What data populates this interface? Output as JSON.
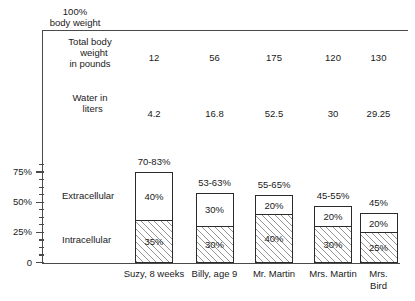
{
  "chart_data": {
    "type": "bar",
    "title": "",
    "top_caption": "100%\nbody weight",
    "xlabel": "",
    "ylabel": "",
    "ylim": [
      0,
      85
    ],
    "grid": false,
    "legend_position": "inline-left",
    "y_ticks": [
      {
        "value": 75,
        "label": "75%"
      },
      {
        "value": 50,
        "label": "50%"
      },
      {
        "value": 25,
        "label": "25%"
      },
      {
        "value": 0,
        "label": "0"
      }
    ],
    "categories": [
      "Suzy,\n8 weeks",
      "Billy,\nage 9",
      "Mr.\nMartin",
      "Mrs.\nMartin",
      "Mrs.\nBird"
    ],
    "series": [
      {
        "name": "Intracellular",
        "values": [
          35,
          30,
          40,
          30,
          25
        ],
        "labels": [
          "35%",
          "30%",
          "40%",
          "30%",
          "25%"
        ]
      },
      {
        "name": "Extracellular",
        "values": [
          40,
          30,
          20,
          20,
          20
        ],
        "labels": [
          "40%",
          "30%",
          "20%",
          "20%",
          "20%"
        ]
      }
    ],
    "bar_totals": [
      75,
      58,
      56,
      47,
      41
    ],
    "bar_total_labels": [
      "70-83%",
      "53-63%",
      "55-65%",
      "45-55%",
      "45%"
    ],
    "data_rows": [
      {
        "label": "Total body\n   weight\nin pounds",
        "values": [
          "12",
          "56",
          "175",
          "120",
          "130"
        ]
      },
      {
        "label": "Water in\n  liters",
        "values": [
          "4.2",
          "16.8",
          "52.5",
          "30",
          "29.25"
        ]
      }
    ],
    "annotations": {
      "extracellular_label": "Extracellular",
      "intracellular_label": "Intracellular"
    },
    "colors": {
      "line": "#4a4a4a",
      "bar_border": "#2b2b2b",
      "extracellular_fill": "#ffffff",
      "intracellular_hatch": "#3c3c3c",
      "text": "#1a1a1a"
    }
  }
}
